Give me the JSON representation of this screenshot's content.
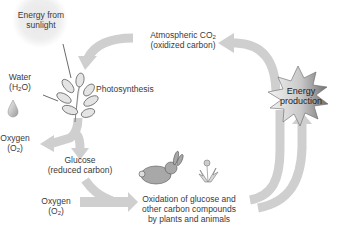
{
  "diagram": {
    "colors": {
      "arrow": "#cfcfcf",
      "starburst_dark": "#7a7a7a",
      "starburst_light": "#f2f2f2",
      "text": "#3a3a3a"
    },
    "nodes": {
      "sunlight": {
        "line1": "Energy from",
        "line2": "sunlight"
      },
      "water": {
        "line1": "Water",
        "line2_pre": "(H",
        "line2_sub": "2",
        "line2_post": "O)"
      },
      "photosynthesis": {
        "label": "Photosynthesis"
      },
      "co2": {
        "line1_pre": "Atmospheric CO",
        "line1_sub": "2",
        "line2": "(oxidized carbon)"
      },
      "energy": {
        "line1": "Energy",
        "line2": "production"
      },
      "oxygen_out": {
        "line1": "Oxygen",
        "line2_pre": "(O",
        "line2_sub": "2",
        "line2_post": ")"
      },
      "glucose": {
        "line1": "Glucose",
        "line2": "(reduced carbon)"
      },
      "oxygen_in": {
        "line1": "Oxygen",
        "line2_pre": "(O",
        "line2_sub": "2",
        "line2_post": ")"
      },
      "oxidation": {
        "line1": "Oxidation of glucose and",
        "line2": "other carbon compounds",
        "line3": "by plants and animals"
      }
    },
    "icons": [
      "sun-glow-icon",
      "leaf-plant-icon",
      "water-drop-icon",
      "rabbit-icon",
      "dandelion-icon",
      "starburst-icon"
    ]
  }
}
